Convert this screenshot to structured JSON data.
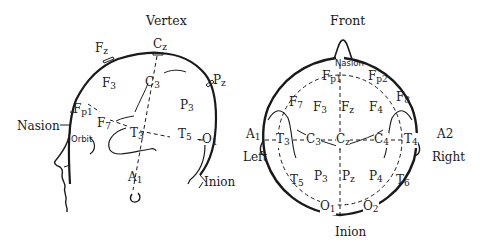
{
  "diagram": {
    "type": "EEG 10-20 electrode placement",
    "side_view": {
      "title": "Vertex",
      "landmarks": {
        "nasion": "Nasion",
        "orbit": "Orbit",
        "inion": "Inion"
      },
      "electrodes": [
        {
          "id": "Fz",
          "base": "F",
          "sub": "z"
        },
        {
          "id": "Cz",
          "base": "C",
          "sub": "z"
        },
        {
          "id": "Pz",
          "base": "P",
          "sub": "z"
        },
        {
          "id": "F3",
          "base": "F",
          "sub": "3"
        },
        {
          "id": "C3",
          "base": "C",
          "sub": "3"
        },
        {
          "id": "P3",
          "base": "P",
          "sub": "3"
        },
        {
          "id": "Fp1",
          "base": "F",
          "sub": "p1"
        },
        {
          "id": "F7",
          "base": "F",
          "sub": "7"
        },
        {
          "id": "T3",
          "base": "T",
          "sub": "3"
        },
        {
          "id": "T5",
          "base": "T",
          "sub": "5"
        },
        {
          "id": "O1",
          "base": "O",
          "sub": "1"
        },
        {
          "id": "A1",
          "base": "A",
          "sub": "1"
        }
      ]
    },
    "top_view": {
      "title": "Front",
      "landmarks": {
        "nasion": "Nasion",
        "inion": "Inion",
        "left": "Left",
        "right": "Right"
      },
      "electrodes": [
        {
          "id": "Fp1",
          "base": "F",
          "sub": "p1"
        },
        {
          "id": "Fp2",
          "base": "F",
          "sub": "p2"
        },
        {
          "id": "F7",
          "base": "F",
          "sub": "7"
        },
        {
          "id": "F3",
          "base": "F",
          "sub": "3"
        },
        {
          "id": "Fz",
          "base": "F",
          "sub": "z"
        },
        {
          "id": "F4",
          "base": "F",
          "sub": "4"
        },
        {
          "id": "F8",
          "base": "F",
          "sub": "8"
        },
        {
          "id": "A1",
          "base": "A",
          "sub": "1"
        },
        {
          "id": "T3",
          "base": "T",
          "sub": "3"
        },
        {
          "id": "C3",
          "base": "C",
          "sub": "3"
        },
        {
          "id": "Cz",
          "base": "C",
          "sub": "z"
        },
        {
          "id": "C4",
          "base": "C",
          "sub": "4"
        },
        {
          "id": "T4",
          "base": "T",
          "sub": "4"
        },
        {
          "id": "A2",
          "base": "A",
          "sub": "2"
        },
        {
          "id": "T5",
          "base": "T",
          "sub": "5"
        },
        {
          "id": "P3",
          "base": "P",
          "sub": "3"
        },
        {
          "id": "Pz",
          "base": "P",
          "sub": "z"
        },
        {
          "id": "P4",
          "base": "P",
          "sub": "4"
        },
        {
          "id": "T6",
          "base": "T",
          "sub": "6"
        },
        {
          "id": "O1",
          "base": "O",
          "sub": "1"
        },
        {
          "id": "O2",
          "base": "O",
          "sub": "2"
        }
      ]
    }
  }
}
